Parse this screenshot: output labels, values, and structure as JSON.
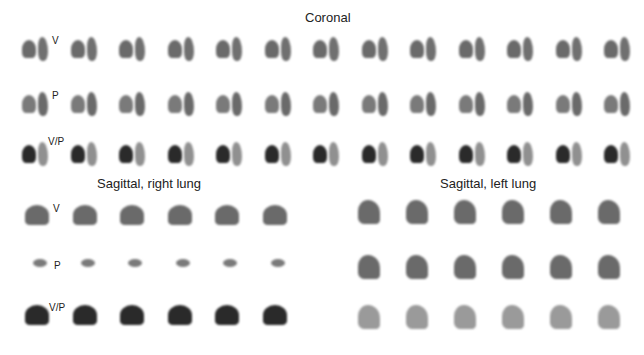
{
  "figure": {
    "sections": [
      {
        "title": "Coronal",
        "rows": [
          {
            "label": "V",
            "count": 13
          },
          {
            "label": "P",
            "count": 13
          },
          {
            "label": "V/P",
            "count": 13
          }
        ]
      },
      {
        "title": "Sagittal, right lung",
        "rows": [
          {
            "label": "V",
            "count": 6
          },
          {
            "label": "P",
            "count": 6
          },
          {
            "label": "V/P",
            "count": 6
          }
        ]
      },
      {
        "title": "Sagittal, left lung",
        "rows": [
          {
            "label": "V",
            "count": 6
          },
          {
            "label": "P",
            "count": 6
          },
          {
            "label": "V/P",
            "count": 6
          }
        ]
      }
    ]
  }
}
